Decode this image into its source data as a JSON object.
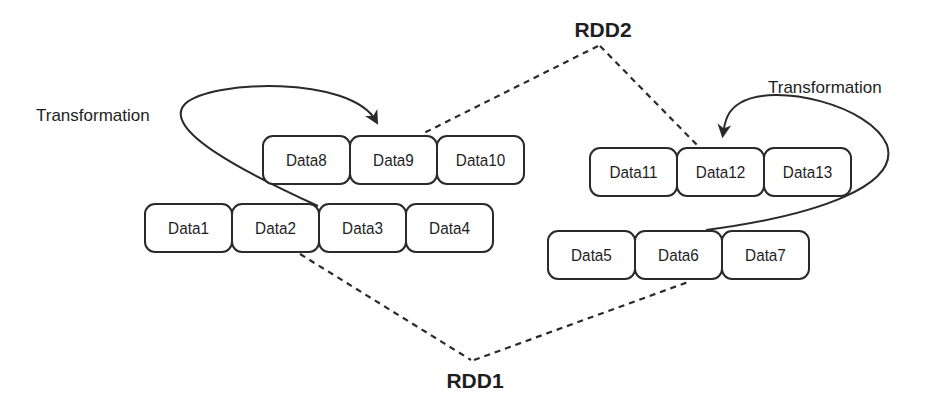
{
  "rdds": [
    {
      "label": "RDD1",
      "partitions": [
        "Data1",
        "Data2",
        "Data3",
        "Data4",
        "Data5",
        "Data6",
        "Data7"
      ]
    },
    {
      "label": "RDD2",
      "partitions": [
        "Data8",
        "Data9",
        "Data10",
        "Data11",
        "Data12",
        "Data13"
      ]
    }
  ],
  "groups": {
    "g1": [
      "Data1",
      "Data2",
      "Data3",
      "Data4"
    ],
    "g2": [
      "Data8",
      "Data9",
      "Data10"
    ],
    "g3": [
      "Data5",
      "Data6",
      "Data7"
    ],
    "g4": [
      "Data11",
      "Data12",
      "Data13"
    ]
  },
  "transformations": [
    {
      "label": "Transformation",
      "from": "Data3",
      "to": "Data9"
    },
    {
      "label": "Transformation",
      "from": "Data6",
      "to": "Data12"
    }
  ],
  "labels": {
    "rdd1": "RDD1",
    "rdd2": "RDD2",
    "transformation_left": "Transformation",
    "transformation_right": "Transformation"
  },
  "colors": {
    "stroke": "#2a2a2a",
    "text": "#1e1e1e",
    "background": "#ffffff"
  }
}
